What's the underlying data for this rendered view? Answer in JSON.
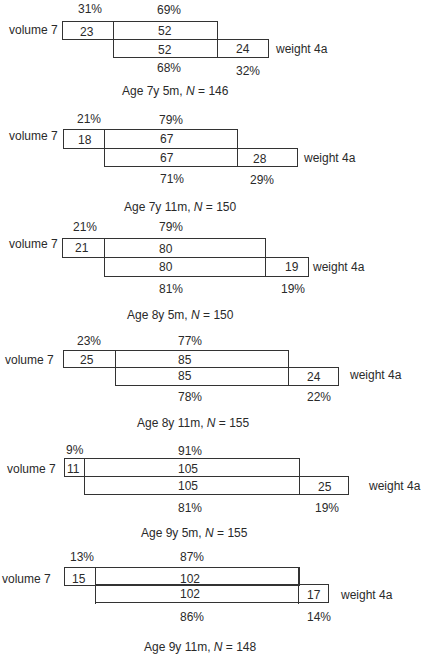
{
  "labels": {
    "row1": "volume 7",
    "row2": "weight 4a"
  },
  "panels": [
    {
      "caption_prefix": "Age 7y 5m, ",
      "n_label": "N",
      "caption_suffix": " = 146",
      "top_pct_left": "31%",
      "top_pct_right": "69%",
      "v_left": "23",
      "v_mid": "52",
      "w_mid": "52",
      "w_right": "24",
      "bot_pct_left": "68%",
      "bot_pct_right": "32%"
    },
    {
      "caption_prefix": "Age 7y 11m, ",
      "n_label": "N",
      "caption_suffix": " = 150",
      "top_pct_left": "21%",
      "top_pct_right": "79%",
      "v_left": "18",
      "v_mid": "67",
      "w_mid": "67",
      "w_right": "28",
      "bot_pct_left": "71%",
      "bot_pct_right": "29%"
    },
    {
      "caption_prefix": "Age 8y 5m, ",
      "n_label": "N",
      "caption_suffix": " = 150",
      "top_pct_left": "21%",
      "top_pct_right": "79%",
      "v_left": "21",
      "v_mid": "80",
      "w_mid": "80",
      "w_right": "19",
      "bot_pct_left": "81%",
      "bot_pct_right": "19%"
    },
    {
      "caption_prefix": "Age 8y 11m, ",
      "n_label": "N",
      "caption_suffix": " = 155",
      "top_pct_left": "23%",
      "top_pct_right": "77%",
      "v_left": "25",
      "v_mid": "85",
      "w_mid": "85",
      "w_right": "24",
      "bot_pct_left": "78%",
      "bot_pct_right": "22%"
    },
    {
      "caption_prefix": "Age 9y 5m, ",
      "n_label": "N",
      "caption_suffix": " = 155",
      "top_pct_left": "9%",
      "top_pct_right": "91%",
      "v_left": "11",
      "v_mid": "105",
      "w_mid": "105",
      "w_right": "25",
      "bot_pct_left": "81%",
      "bot_pct_right": "19%"
    },
    {
      "caption_prefix": "Age 9y 11m, ",
      "n_label": "N",
      "caption_suffix": " = 148",
      "top_pct_left": "13%",
      "top_pct_right": "87%",
      "v_left": "15",
      "v_mid": "102",
      "w_mid": "102",
      "w_right": "17",
      "bot_pct_left": "86%",
      "bot_pct_right": "14%"
    }
  ]
}
